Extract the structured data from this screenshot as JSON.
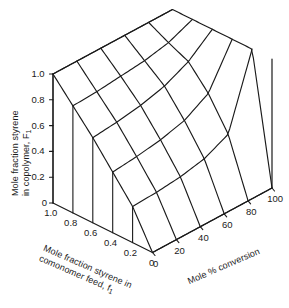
{
  "chart_data": {
    "type": "line",
    "subtype": "3d-surface-mesh",
    "title": "",
    "projection": {
      "kind": "isometric-3d",
      "note": "Two families of mesh curves: constant comonomer feed f1 and constant mole % conversion"
    },
    "axes": {
      "z": {
        "label_line1": "Mole fraction styrene",
        "label_line2": "in copolymer, F",
        "label_sub": "1",
        "ticks": [
          "0",
          "0.2",
          "0.4",
          "0.6",
          "0.8",
          "1.0"
        ],
        "values": [
          0,
          0.2,
          0.4,
          0.6,
          0.8,
          1.0
        ],
        "min": 0,
        "max": 1.0
      },
      "x": {
        "label_line1": "Mole fraction styrene in",
        "label_line2": "comonomer feed, f",
        "label_sub": "1",
        "ticks": [
          "1.0",
          "0.8",
          "0.6",
          "0.4",
          "0.2",
          "0"
        ],
        "values": [
          1.0,
          0.8,
          0.6,
          0.4,
          0.2,
          0
        ],
        "min": 0,
        "max": 1.0
      },
      "y": {
        "label": "Mole % conversion",
        "ticks": [
          "0",
          "20",
          "40",
          "60",
          "80",
          "100"
        ],
        "values": [
          0,
          20,
          40,
          60,
          80,
          100
        ],
        "min": 0,
        "max": 100
      }
    },
    "series": [
      {
        "name": "f1 = 1.0",
        "f1": 1.0,
        "conversion": [
          0,
          20,
          40,
          60,
          80,
          100
        ],
        "F1": [
          1.0,
          1.0,
          1.0,
          1.0,
          1.0,
          1.0
        ]
      },
      {
        "name": "f1 = 0.8",
        "f1": 0.8,
        "conversion": [
          0,
          20,
          40,
          60,
          80,
          100
        ],
        "F1": [
          0.83,
          0.84,
          0.86,
          0.88,
          0.92,
          1.0
        ]
      },
      {
        "name": "f1 = 0.6",
        "f1": 0.6,
        "conversion": [
          0,
          20,
          40,
          60,
          80,
          100
        ],
        "F1": [
          0.66,
          0.68,
          0.71,
          0.76,
          0.85,
          1.0
        ]
      },
      {
        "name": "f1 = 0.4",
        "f1": 0.4,
        "conversion": [
          0,
          20,
          40,
          60,
          80,
          100
        ],
        "F1": [
          0.47,
          0.49,
          0.52,
          0.57,
          0.68,
          1.0
        ]
      },
      {
        "name": "f1 = 0.2",
        "f1": 0.2,
        "conversion": [
          0,
          20,
          40,
          60,
          80,
          100
        ],
        "F1": [
          0.28,
          0.29,
          0.31,
          0.35,
          0.44,
          1.0
        ]
      },
      {
        "name": "f1 = 0.0",
        "f1": 0.0,
        "conversion": [
          0,
          20,
          40,
          60,
          80,
          100
        ],
        "F1": [
          0.0,
          0.0,
          0.0,
          0.0,
          0.0,
          0.0
        ]
      }
    ],
    "iso_conversion_curves": [
      {
        "name": "conversion = 0",
        "conversion": 0,
        "f1": [
          1.0,
          0.8,
          0.6,
          0.4,
          0.2,
          0.0
        ],
        "F1": [
          1.0,
          0.83,
          0.66,
          0.47,
          0.28,
          0.0
        ]
      },
      {
        "name": "conversion = 20",
        "conversion": 20,
        "f1": [
          1.0,
          0.8,
          0.6,
          0.4,
          0.2,
          0.0
        ],
        "F1": [
          1.0,
          0.84,
          0.68,
          0.49,
          0.29,
          0.0
        ]
      },
      {
        "name": "conversion = 40",
        "conversion": 40,
        "f1": [
          1.0,
          0.8,
          0.6,
          0.4,
          0.2,
          0.0
        ],
        "F1": [
          1.0,
          0.86,
          0.71,
          0.52,
          0.31,
          0.0
        ]
      },
      {
        "name": "conversion = 60",
        "conversion": 60,
        "f1": [
          1.0,
          0.8,
          0.6,
          0.4,
          0.2,
          0.0
        ],
        "F1": [
          1.0,
          0.88,
          0.76,
          0.57,
          0.35,
          0.0
        ]
      },
      {
        "name": "conversion = 80",
        "conversion": 80,
        "f1": [
          1.0,
          0.8,
          0.6,
          0.4,
          0.2,
          0.0
        ],
        "F1": [
          1.0,
          0.92,
          0.85,
          0.68,
          0.44,
          0.0
        ]
      },
      {
        "name": "conversion = 100",
        "conversion": 100,
        "f1": [
          1.0,
          0.8,
          0.6,
          0.4,
          0.2,
          0.0
        ],
        "F1": [
          1.0,
          1.0,
          1.0,
          1.0,
          1.0,
          0.0
        ]
      }
    ],
    "grid": true,
    "legend": "none",
    "line_color": "#1a1a1a",
    "background": "#ffffff"
  }
}
